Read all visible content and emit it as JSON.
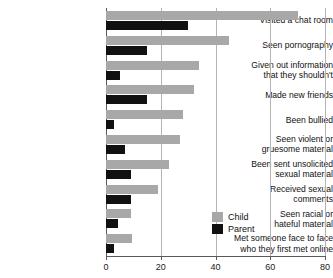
{
  "chart_data": {
    "type": "bar",
    "orientation": "horizontal",
    "title": "",
    "xlabel": "",
    "ylabel": "",
    "xlim": [
      0,
      80
    ],
    "xticks": [
      0,
      20,
      40,
      60,
      80
    ],
    "xtick_labels": [
      "0",
      "20",
      "40",
      "60",
      "80"
    ],
    "grid": true,
    "grid_axis": "x",
    "legend_position": "bottom-right",
    "categories": [
      "Visited a chat room",
      "Seen pornography",
      "Given out information\nthat they shouldn't",
      "Made new friends",
      "Been bullied",
      "Seen violent or\ngruesome material",
      "Been sent unsolicited\nsexual material",
      "Received sexual\ncomments",
      "Seen racial or\nhateful material",
      "Met someone face to face\nwho they first met online"
    ],
    "series": [
      {
        "name": "Child",
        "color": "#a8a8a8",
        "values": [
          70,
          45,
          34,
          32,
          28,
          27,
          23,
          19,
          9,
          9.5
        ]
      },
      {
        "name": "Parent",
        "color": "#111111",
        "values": [
          30,
          15,
          5,
          15,
          3,
          7,
          9,
          9,
          4.5,
          3
        ]
      }
    ]
  },
  "legend": {
    "entries": [
      {
        "label": "Child"
      },
      {
        "label": "Parent"
      }
    ]
  }
}
